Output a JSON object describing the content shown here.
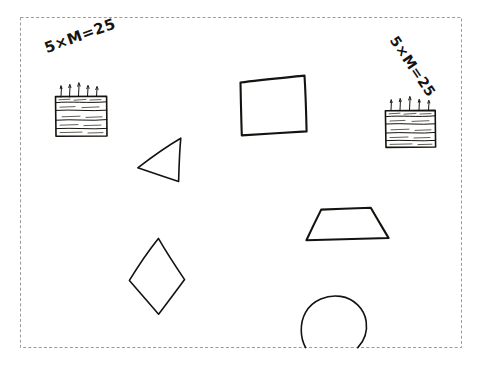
{
  "page": {
    "background_color": "#ffffff",
    "ink_color": "#15130f",
    "border": {
      "style": "dashed",
      "color": "#9b9b9b",
      "x": 20,
      "y": 17,
      "width": 442,
      "height": 331
    }
  },
  "equations": [
    {
      "id": "equation-left",
      "text": "5×M=25",
      "rotation_deg": -20,
      "x": 42,
      "y": 40
    },
    {
      "id": "equation-right",
      "text": "5×M=25",
      "rotation_deg": 56,
      "x": 400,
      "y": 33
    }
  ],
  "cakes": [
    {
      "id": "cake-left",
      "label": "birthday cake with 5 candles",
      "candle_count": 5,
      "layer_lines": 3,
      "x": 55,
      "y": 96,
      "width": 52,
      "height": 40
    },
    {
      "id": "cake-right",
      "label": "birthday cake with 5 candles",
      "candle_count": 5,
      "layer_lines": 3,
      "x": 385,
      "y": 110,
      "width": 50,
      "height": 37
    }
  ],
  "shapes": [
    {
      "id": "shape-square",
      "name": "square",
      "sides": 4
    },
    {
      "id": "shape-triangle",
      "name": "triangle",
      "sides": 3
    },
    {
      "id": "shape-trapezoid",
      "name": "trapezoid",
      "sides": 4
    },
    {
      "id": "shape-rhombus",
      "name": "rhombus",
      "sides": 4
    },
    {
      "id": "shape-circle",
      "name": "circle",
      "sides": 0
    }
  ]
}
